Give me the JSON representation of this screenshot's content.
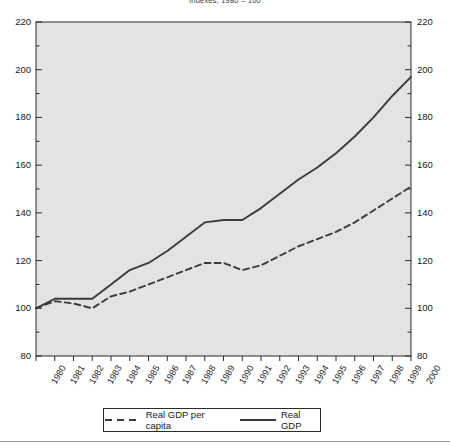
{
  "chart_data": {
    "type": "line",
    "title": "Indexes, 1980 = 100",
    "xlabel": "",
    "ylabel": "",
    "ylim": [
      80,
      220
    ],
    "ytick_step": 20,
    "yminor_step": 10,
    "grid": false,
    "legend_position": "bottom",
    "x": [
      1980,
      1981,
      1982,
      1983,
      1984,
      1985,
      1986,
      1987,
      1988,
      1989,
      1990,
      1991,
      1992,
      1993,
      1994,
      1995,
      1996,
      1997,
      1998,
      1999,
      2000
    ],
    "ytick_labels": [
      "80",
      "100",
      "120",
      "140",
      "160",
      "180",
      "200",
      "220"
    ],
    "ytick_values": [
      80,
      100,
      120,
      140,
      160,
      180,
      200,
      220
    ],
    "xtick_labels": [
      "1980",
      "1981",
      "1982",
      "1983",
      "1984",
      "1985",
      "1986",
      "1987",
      "1988",
      "1989",
      "1990",
      "1991",
      "1992",
      "1993",
      "1994",
      "1995",
      "1996",
      "1997",
      "1998",
      "1999",
      "2000"
    ],
    "series": [
      {
        "name": "Real GDP per capita",
        "style": "dashed",
        "color": "#3b3b3b",
        "values": [
          100,
          103,
          102,
          100,
          105,
          107,
          110,
          113,
          116,
          119,
          119,
          116,
          118,
          122,
          126,
          129,
          132,
          136,
          141,
          146,
          151
        ]
      },
      {
        "name": "Real GDP",
        "style": "solid",
        "color": "#3b3b3b",
        "values": [
          100,
          104,
          104,
          104,
          110,
          116,
          119,
          124,
          130,
          136,
          137,
          137,
          142,
          148,
          154,
          159,
          165,
          172,
          180,
          189,
          197
        ]
      }
    ]
  },
  "legend": {
    "items": [
      {
        "label": "Real GDP per capita",
        "style": "dashed"
      },
      {
        "label": "Real GDP",
        "style": "solid"
      }
    ]
  }
}
